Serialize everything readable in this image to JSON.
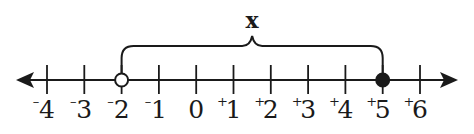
{
  "diagram": {
    "type": "number-line",
    "variable_label": "x",
    "axis": {
      "min": -4,
      "max": 6,
      "arrows": "both"
    },
    "ticks": [
      {
        "value": -4,
        "sign": "-",
        "digit": "4"
      },
      {
        "value": -3,
        "sign": "-",
        "digit": "3"
      },
      {
        "value": -2,
        "sign": "-",
        "digit": "2"
      },
      {
        "value": -1,
        "sign": "-",
        "digit": "1"
      },
      {
        "value": 0,
        "sign": "",
        "digit": "0"
      },
      {
        "value": 1,
        "sign": "+",
        "digit": "1"
      },
      {
        "value": 2,
        "sign": "+",
        "digit": "2"
      },
      {
        "value": 3,
        "sign": "+",
        "digit": "3"
      },
      {
        "value": 4,
        "sign": "+",
        "digit": "4"
      },
      {
        "value": 5,
        "sign": "+",
        "digit": "5"
      },
      {
        "value": 6,
        "sign": "+",
        "digit": "6"
      }
    ],
    "interval": {
      "start": {
        "value": -2,
        "endpoint": "open"
      },
      "end": {
        "value": 5,
        "endpoint": "closed"
      },
      "inequality": "-2 < x ≤ 5"
    },
    "colors": {
      "ink": "#1a1a1a",
      "background": "#ffffff"
    }
  }
}
